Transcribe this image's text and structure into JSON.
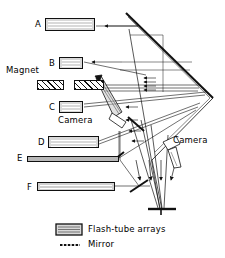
{
  "diagram": {
    "stroke_color": "#111111",
    "array_fill": "#d9d9d9",
    "magnet_fill": "#ffffff"
  },
  "flash_tube_arrays": [
    {
      "id": "A",
      "label": "A",
      "x": 45,
      "y": 18,
      "w": 50,
      "h": 13,
      "lines": 4
    },
    {
      "id": "B",
      "label": "B",
      "x": 59,
      "y": 57,
      "w": 24,
      "h": 12,
      "lines": 4
    },
    {
      "id": "C",
      "label": "C",
      "x": 59,
      "y": 101,
      "w": 24,
      "h": 12,
      "lines": 4
    },
    {
      "id": "D",
      "label": "D",
      "x": 48,
      "y": 136,
      "w": 51,
      "h": 12,
      "lines": 3
    },
    {
      "id": "E",
      "label": "E",
      "x": 27,
      "y": 156,
      "w": 92,
      "h": 6,
      "lines": 1
    },
    {
      "id": "F",
      "label": "F",
      "x": 37,
      "y": 182,
      "w": 78,
      "h": 9,
      "lines": 2
    }
  ],
  "magnets": {
    "label": "Magnet",
    "label_x": 6,
    "label_y": 68,
    "blocks": [
      {
        "x": 37,
        "y": 80,
        "w": 27,
        "h": 10
      },
      {
        "x": 74,
        "y": 80,
        "w": 30,
        "h": 10
      }
    ]
  },
  "cameras": [
    {
      "label": "Camera",
      "label_x": 58,
      "label_y": 118
    },
    {
      "label": "Camera",
      "label_x": 173,
      "label_y": 140
    }
  ],
  "legend": {
    "items": [
      {
        "symbol": "flash-tube-swatch",
        "label": "Flash-tube arrays"
      },
      {
        "symbol": "mirror-dash",
        "label": "Mirror"
      }
    ]
  }
}
